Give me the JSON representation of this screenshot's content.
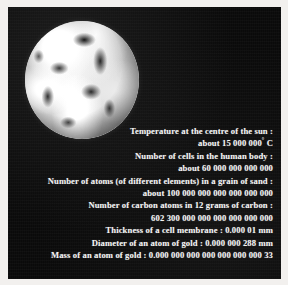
{
  "panel": {
    "background_color": "#0a0a0a",
    "text_color": "#f4f4f4",
    "border_color": "#f2f0ee"
  },
  "image": {
    "subject": "earth-photograph",
    "description": "Black and white photograph of planet Earth from space"
  },
  "facts": [
    {
      "label": "Temperature at the centre of the sun  :",
      "value": "about 15 000 000",
      "degree": "°",
      "unit": " C",
      "two_line": true
    },
    {
      "label": "Number of cells in the human body  :",
      "value": "about 60 000 000 000 000",
      "two_line": true
    },
    {
      "label": "Number of atoms (of different elements) in a grain of sand  :",
      "value": "about 100 000 000 000 000 000 000",
      "two_line": true
    },
    {
      "label": "Number of carbon atoms in 12 grams of carbon  :",
      "value": "602 300 000 000 000 000 000 000",
      "two_line": true
    },
    {
      "inline": "Thickness of a cell membrane  : 0.000 01 mm",
      "two_line": false
    },
    {
      "inline": "Diameter of an atom of gold  : 0.000 000 288 mm",
      "two_line": false
    },
    {
      "inline": "Mass of an atom of gold  : 0.000 000 000 000 000 000 000 33",
      "two_line": false
    }
  ]
}
